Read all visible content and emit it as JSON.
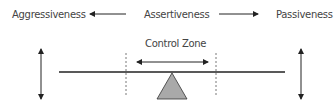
{
  "labels": {
    "left": "Aggressiveness",
    "center": "Assertiveness",
    "right": "Passiveness",
    "zone": "Control Zone"
  },
  "colors": {
    "line": "#222222",
    "fulcrum_fill": "#a9a9a9",
    "text": "#444444"
  }
}
